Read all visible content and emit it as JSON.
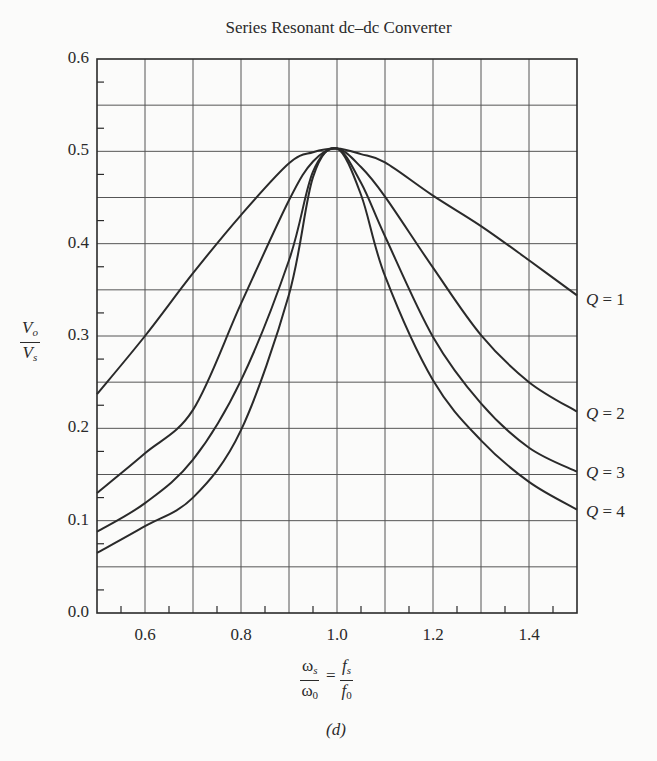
{
  "chart_data": {
    "type": "line",
    "title": "Series Resonant dc–dc Converter",
    "xlabel": "ωs/ω0 = fs/f0",
    "ylabel": "Vo/Vs",
    "caption": "(d)",
    "xlim": [
      0.5,
      1.5
    ],
    "ylim": [
      0.0,
      0.6
    ],
    "grid": true,
    "legend_position": "right, inline labels at curve ends",
    "x_ticks": [
      "0.6",
      "0.8",
      "1.0",
      "1.2",
      "1.4"
    ],
    "y_ticks": [
      "0.0",
      "0.1",
      "0.2",
      "0.3",
      "0.4",
      "0.5",
      "0.6"
    ],
    "x": [
      0.5,
      0.6,
      0.7,
      0.8,
      0.9,
      0.95,
      1.0,
      1.05,
      1.1,
      1.2,
      1.3,
      1.4,
      1.5
    ],
    "series": [
      {
        "name": "Q = 1",
        "values": [
          0.237,
          0.3,
          0.368,
          0.431,
          0.487,
          0.499,
          0.503,
          0.497,
          0.488,
          0.452,
          0.419,
          0.382,
          0.344
        ]
      },
      {
        "name": "Q = 2",
        "values": [
          0.13,
          0.173,
          0.22,
          0.335,
          0.447,
          0.489,
          0.503,
          0.483,
          0.451,
          0.374,
          0.301,
          0.25,
          0.218
        ]
      },
      {
        "name": "Q = 3",
        "values": [
          0.088,
          0.119,
          0.166,
          0.252,
          0.382,
          0.478,
          0.503,
          0.466,
          0.408,
          0.299,
          0.227,
          0.179,
          0.153
        ]
      },
      {
        "name": "Q = 4",
        "values": [
          0.065,
          0.094,
          0.125,
          0.198,
          0.345,
          0.472,
          0.503,
          0.453,
          0.365,
          0.252,
          0.187,
          0.142,
          0.112
        ]
      }
    ]
  },
  "labels": {
    "title": "Series Resonant dc–dc Converter",
    "caption": "(d)",
    "y_num": "V",
    "y_num_sub": "o",
    "y_den": "V",
    "y_den_sub": "s",
    "x_num1": "ω",
    "x_num1_sub": "s",
    "x_den1": "ω",
    "x_den1_sub": "0",
    "x_eq": "=",
    "x_num2": "f",
    "x_num2_sub": "s",
    "x_den2": "f",
    "x_den2_sub": "0",
    "q_prefix": "Q",
    "q1": "= 1",
    "q2": "= 2",
    "q3": "= 3",
    "q4": "= 4"
  },
  "colors": {
    "line": "#2a2a2a",
    "grid": "#555555",
    "background": "#fbfbfa"
  }
}
